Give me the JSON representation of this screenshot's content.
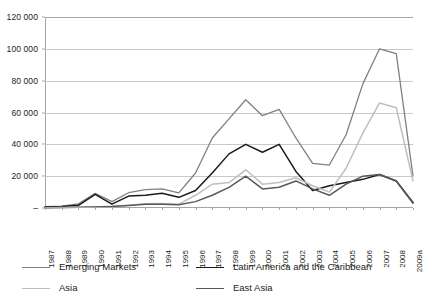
{
  "chart_data": {
    "type": "line",
    "title": "",
    "xlabel": "",
    "ylabel": "",
    "ylim": [
      0,
      120000
    ],
    "ytick_step": 20000,
    "grid": true,
    "legend_position": "bottom",
    "ytick_labels": [
      "120 000",
      "100 000",
      "80 000",
      "60 000",
      "40 000",
      "20 000",
      "–"
    ],
    "ytick_values": [
      120000,
      100000,
      80000,
      60000,
      40000,
      20000,
      0
    ],
    "categories": [
      "1987",
      "1988",
      "1989",
      "1990",
      "1991",
      "1992",
      "1993",
      "1994",
      "1995",
      "1996",
      "1997",
      "1998",
      "1999",
      "2000",
      "2001",
      "2002",
      "2003",
      "2004",
      "2005",
      "2006",
      "2007",
      "2008",
      "2009a"
    ],
    "series": [
      {
        "name": "Emerging Markets",
        "color": "#808080",
        "width": 1.3,
        "values": [
          900,
          1200,
          2600,
          9200,
          4000,
          9600,
          11500,
          12000,
          9500,
          22000,
          44000,
          56000,
          68000,
          58000,
          62000,
          44000,
          28000,
          27000,
          46000,
          78000,
          100000,
          97000,
          20000
        ]
      },
      {
        "name": "Latin America and the Caribbean",
        "color": "#1a1a1a",
        "width": 1.5,
        "values": [
          700,
          900,
          1700,
          8600,
          2400,
          7500,
          8000,
          9300,
          6700,
          11000,
          22000,
          34000,
          40000,
          35000,
          40000,
          23000,
          11000,
          14000,
          16000,
          18000,
          21000,
          17000,
          3500
        ]
      },
      {
        "name": "Asia",
        "color": "#bfbfbf",
        "width": 1.5,
        "values": [
          200,
          300,
          500,
          700,
          1100,
          1800,
          2700,
          2800,
          2400,
          8000,
          15000,
          16000,
          24000,
          15000,
          16000,
          19000,
          14000,
          10000,
          25000,
          47000,
          66000,
          63000,
          17000
        ]
      },
      {
        "name": "East Asia",
        "color": "#595959",
        "width": 1.5,
        "values": [
          150,
          250,
          400,
          600,
          900,
          1500,
          2300,
          2400,
          2000,
          4000,
          8000,
          13000,
          20000,
          12000,
          13000,
          17000,
          12000,
          8000,
          15000,
          20000,
          21000,
          17000,
          3000
        ]
      }
    ]
  },
  "legend": {
    "items": [
      {
        "label": "Emerging Markets",
        "color": "#808080"
      },
      {
        "label": "Latin America and the Caribbean",
        "color": "#1a1a1a"
      },
      {
        "label": "Asia",
        "color": "#bfbfbf"
      },
      {
        "label": "East Asia",
        "color": "#595959"
      }
    ]
  }
}
